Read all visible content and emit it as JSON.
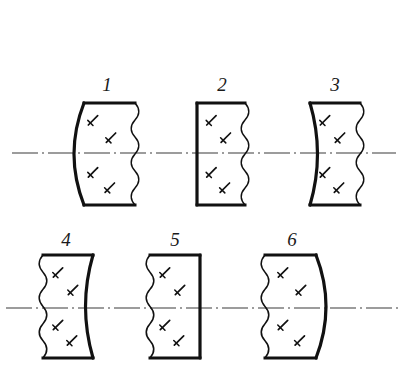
{
  "figure": {
    "kind": "technical-drawing",
    "background_color": "#ffffff",
    "ink_color": "#111111",
    "axis_color": "#3a3a3a",
    "rows": 2,
    "columns": 3,
    "total_items": 6
  },
  "axes": [
    {
      "name": "optical-axis-top",
      "y": 153,
      "x_start": 12,
      "x_end": 396,
      "style": "dash-dot"
    },
    {
      "name": "optical-axis-bottom",
      "y": 308,
      "x_start": 6,
      "x_end": 400,
      "style": "dash-dot"
    }
  ],
  "lenses": [
    {
      "number": "1",
      "label_x": 107,
      "label_y": 85,
      "x": 75,
      "y": 103,
      "width": 60,
      "height": 102,
      "left_edge": "concave-arc",
      "right_edge": "wavy-break-line",
      "description": "plano-concave element, broken-out right side"
    },
    {
      "number": "2",
      "label_x": 222,
      "label_y": 85,
      "x": 197,
      "y": 103,
      "width": 48,
      "height": 102,
      "left_edge": "straight",
      "right_edge": "wavy-break-line",
      "description": "flat left face, broken-out right side"
    },
    {
      "number": "3",
      "label_x": 335,
      "label_y": 85,
      "x": 310,
      "y": 103,
      "width": 50,
      "height": 102,
      "left_edge": "convex-arc-inward",
      "right_edge": "wavy-break-line",
      "description": "left face curved inward, broken-out right side"
    },
    {
      "number": "4",
      "label_x": 66,
      "label_y": 240,
      "x": 43,
      "y": 255,
      "width": 50,
      "height": 103,
      "left_edge": "wavy-break-line",
      "right_edge": "convex-arc-inward",
      "description": "broken-out left side, right face curved inward"
    },
    {
      "number": "5",
      "label_x": 175,
      "label_y": 240,
      "x": 150,
      "y": 255,
      "width": 50,
      "height": 103,
      "left_edge": "wavy-break-line",
      "right_edge": "straight",
      "description": "broken-out left side, flat right face"
    },
    {
      "number": "6",
      "label_x": 292,
      "label_y": 240,
      "x": 265,
      "y": 255,
      "width": 60,
      "height": 103,
      "left_edge": "wavy-break-line",
      "right_edge": "convex-arc",
      "description": "broken-out left side, convex right face"
    }
  ],
  "hatch_marks": {
    "symbol": "glass-hatch-stroke",
    "per_lens": 4,
    "note": "short diagonal stroke with perpendicular tick, two above and two below the axis"
  }
}
